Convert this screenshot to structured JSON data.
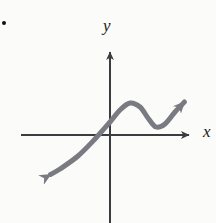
{
  "figure": {
    "kind": "cartesian-graph-sketch",
    "background_color": "#fbfbf9",
    "width": 216,
    "height": 223,
    "bullet_marker": {
      "name": "list-bullet",
      "color": "#121212",
      "x": 4,
      "y": 23,
      "radius": 2
    },
    "axes": {
      "color": "#3b3b42",
      "stroke_width": 2,
      "origin": {
        "x": 110,
        "y": 135
      },
      "x_axis": {
        "label": "x",
        "start_x": 21,
        "end_x": 196,
        "y": 135,
        "arrow": "right"
      },
      "y_axis": {
        "label": "y",
        "x": 110,
        "top_y": 45,
        "bottom_y": 223,
        "arrow": "up"
      }
    },
    "curve": {
      "name": "cubic-like-increasing-curve",
      "color": "#7a7a82",
      "stroke_width": 5,
      "arrow_start": true,
      "arrow_end": true,
      "description": "S-shaped increasing curve with one local maximum and one local minimum, arrows at both ends",
      "points": [
        {
          "x": 41,
          "y": 180
        },
        {
          "x": 60,
          "y": 169
        },
        {
          "x": 78,
          "y": 156
        },
        {
          "x": 95,
          "y": 139
        },
        {
          "x": 110,
          "y": 122
        },
        {
          "x": 120,
          "y": 110
        },
        {
          "x": 130,
          "y": 103
        },
        {
          "x": 140,
          "y": 107
        },
        {
          "x": 148,
          "y": 118
        },
        {
          "x": 156,
          "y": 127
        },
        {
          "x": 165,
          "y": 124
        },
        {
          "x": 175,
          "y": 112
        },
        {
          "x": 192,
          "y": 94
        }
      ],
      "local_maximum": {
        "x": 130,
        "y": 103
      },
      "local_minimum": {
        "x": 156,
        "y": 127
      },
      "start_arrow_tip": {
        "x": 41,
        "y": 180
      },
      "end_arrow_tip": {
        "x": 192,
        "y": 94
      }
    }
  },
  "chart_data": {
    "type": "line",
    "title": "",
    "xlabel": "x",
    "ylabel": "y",
    "grid": false,
    "legend": "none",
    "annotations": [],
    "series": [
      {
        "name": "curve",
        "x": [
          41,
          60,
          78,
          95,
          110,
          120,
          130,
          140,
          148,
          156,
          165,
          175,
          192
        ],
        "values": [
          180,
          169,
          156,
          139,
          122,
          110,
          103,
          107,
          118,
          127,
          124,
          112,
          94
        ]
      }
    ],
    "xlim": [
      21,
      196
    ],
    "ylim": [
      223,
      45
    ]
  }
}
